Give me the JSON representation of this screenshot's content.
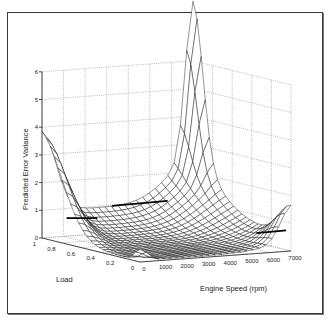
{
  "chart_data": {
    "type": "surface3d",
    "title": "",
    "xlabel": "Engine Speed (rpm)",
    "ylabel": "Load",
    "zlabel": "Predicted Error Variance",
    "x_ticks": [
      "0",
      "1000",
      "2000",
      "3000",
      "4000",
      "5000",
      "6000",
      "7000"
    ],
    "y_ticks": [
      "0",
      "0.2",
      "0.4",
      "0.6",
      "0.8",
      "1"
    ],
    "z_ticks": [
      "0",
      "1",
      "2",
      "3",
      "4",
      "5",
      "6"
    ],
    "xlim": [
      0,
      7000
    ],
    "ylim": [
      0,
      1
    ],
    "zlim": [
      0,
      6
    ],
    "grid": true,
    "style": "black wireframe mesh on white, dotted grid on back walls",
    "features": [
      {
        "description": "peak near Load=1, Speed=0",
        "z": 3.0
      },
      {
        "description": "sharp spike near Load=1, Speed=7000 (back corner)",
        "z": 5.6
      },
      {
        "description": "small bump near Load=0, Speed=7000",
        "z": 1.2
      },
      {
        "description": "small bump near Load=0, Speed=0",
        "z": 0.4
      },
      {
        "description": "flat minimum basin in centre",
        "z": 0.05
      }
    ],
    "highlight_lines": "thick black contour segments at roughly z=0.8-1.1"
  },
  "labels": {
    "z_axis": "Predicted Error Variance",
    "y_axis": "Load",
    "x_axis": "Engine Speed (rpm)"
  }
}
